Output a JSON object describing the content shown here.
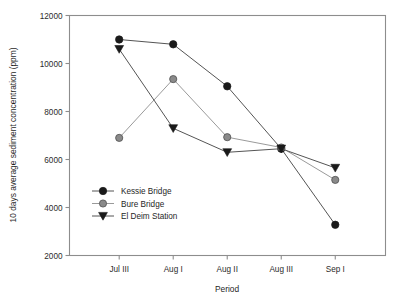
{
  "chart_data": {
    "type": "line",
    "title": "",
    "xlabel": "Period",
    "ylabel": "10 days average sediment concentration (ppm)",
    "categories": [
      "Jul III",
      "Aug I",
      "Aug II",
      "Aug III",
      "Sep I"
    ],
    "ylim": [
      2000,
      12000
    ],
    "ytick_values": [
      2000,
      4000,
      6000,
      8000,
      10000,
      12000
    ],
    "ytick_labels": [
      "2000",
      "4000",
      "6000",
      "8000",
      "10000",
      "12000"
    ],
    "grid": false,
    "legend_position": "inside-lower-left",
    "series": [
      {
        "name": "Kessie Bridge",
        "values": [
          11000,
          10800,
          9050,
          6450,
          3280
        ],
        "marker": "circle-filled",
        "color": "#1a1a1a",
        "line_color": "#555555"
      },
      {
        "name": "Bure Bridge",
        "values": [
          6900,
          9350,
          6930,
          6500,
          5150
        ],
        "marker": "circle-gray",
        "color": "#8a8a8a",
        "line_color": "#9a9a9a"
      },
      {
        "name": "El Deim Station",
        "values": [
          10600,
          7300,
          6300,
          6450,
          5650
        ],
        "marker": "triangle-down-filled",
        "color": "#1a1a1a",
        "line_color": "#555555"
      }
    ]
  },
  "legend": {
    "entries": [
      {
        "label": "Kessie Bridge"
      },
      {
        "label": "Bure Bridge"
      },
      {
        "label": "El Deim Station"
      }
    ]
  }
}
